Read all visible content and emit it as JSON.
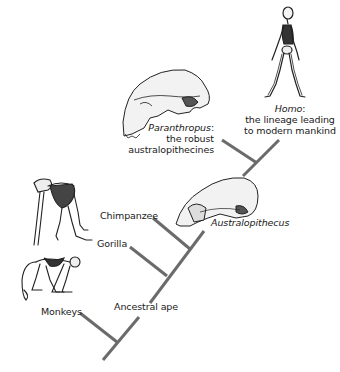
{
  "diagram": {
    "type": "cladogram",
    "line_color": "#6b6b6b",
    "nodes": [
      {
        "id": "monkeys",
        "label": "Monkeys",
        "illustration": "monkey-skeleton"
      },
      {
        "id": "ancestral_ape",
        "label": "Ancestral ape"
      },
      {
        "id": "gorilla",
        "label": "Gorilla",
        "illustration": "ape-skeleton"
      },
      {
        "id": "chimpanzee",
        "label": "Chimpanzee"
      },
      {
        "id": "australopithecus",
        "label": "Australopithecus",
        "illustration": "australopithecus-skull"
      },
      {
        "id": "paranthropus",
        "label": "Paranthropus",
        "label_suffix": ":",
        "description_lines": [
          "the robust",
          "australopithecines"
        ],
        "illustration": "paranthropus-skull"
      },
      {
        "id": "homo",
        "label": "Homo",
        "label_suffix": ":",
        "description_lines": [
          "the lineage leading",
          "to modern mankind"
        ],
        "illustration": "human-skeleton"
      }
    ]
  }
}
